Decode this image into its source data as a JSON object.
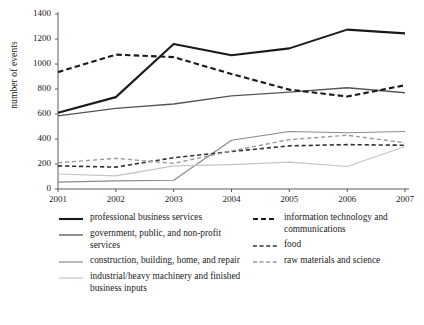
{
  "chart_data": {
    "type": "line",
    "title": "",
    "xlabel": "",
    "ylabel": "number of events",
    "x": [
      2001,
      2002,
      2003,
      2004,
      2005,
      2006,
      2007
    ],
    "xtick_labels": [
      "2001",
      "2002",
      "2003",
      "2004",
      "2005",
      "2006",
      "2007"
    ],
    "ytick_labels": [
      "0",
      "200",
      "400",
      "600",
      "800",
      "1000",
      "1200",
      "1400"
    ],
    "yticks": [
      0,
      200,
      400,
      600,
      800,
      1000,
      1200,
      1400
    ],
    "ylim": [
      0,
      1400
    ],
    "xlim": [
      2001,
      2007
    ],
    "grid": false,
    "legend_position": "below",
    "series": [
      {
        "name": "professional business services",
        "style": "solid",
        "color": "#1a1a1a",
        "width": 2.1,
        "values": [
          610,
          735,
          1160,
          1070,
          1125,
          1275,
          1245
        ]
      },
      {
        "name": "government, public, and non-profit services",
        "style": "solid",
        "color": "#555555",
        "width": 1.3,
        "values": [
          585,
          645,
          680,
          745,
          775,
          810,
          770
        ]
      },
      {
        "name": "construction, building, home, and repair",
        "style": "solid",
        "color": "#8a8a8a",
        "width": 1.2,
        "values": [
          55,
          65,
          70,
          390,
          460,
          450,
          460
        ]
      },
      {
        "name": "industrial/heavy machinery and finished business inputs",
        "style": "solid",
        "color": "#c4c4c4",
        "width": 1.2,
        "values": [
          120,
          105,
          185,
          195,
          215,
          180,
          340
        ]
      },
      {
        "name": "information technology and communications",
        "style": "dashed",
        "color": "#1a1a1a",
        "width": 2.1,
        "values": [
          935,
          1075,
          1055,
          920,
          795,
          740,
          830
        ]
      },
      {
        "name": "food",
        "style": "dashed",
        "color": "#333333",
        "width": 1.6,
        "values": [
          185,
          175,
          250,
          300,
          345,
          355,
          350
        ]
      },
      {
        "name": "raw materials and science",
        "style": "dashed",
        "color": "#9a9a9a",
        "width": 1.4,
        "values": [
          210,
          245,
          205,
          305,
          395,
          430,
          370
        ]
      }
    ]
  },
  "legend": {
    "left_column": [
      {
        "label": "professional business services",
        "swatch": "solid-thick-black"
      },
      {
        "label": "government, public, and non-profit services",
        "swatch": "solid-dark-gray"
      },
      {
        "label": "construction, building, home, and repair",
        "swatch": "solid-medium-gray"
      },
      {
        "label": "industrial/heavy machinery and finished business inputs",
        "swatch": "solid-light-gray"
      }
    ],
    "right_column": [
      {
        "label": "information technology and communications",
        "swatch": "dashed-thick-black"
      },
      {
        "label": "food",
        "swatch": "dashed-dark-gray"
      },
      {
        "label": "raw materials and science",
        "swatch": "dashed-light-gray"
      }
    ]
  },
  "axis": {
    "y_title": "number of events"
  },
  "colors": {
    "axis": "#5a5a5a",
    "text": "#1a1a1a",
    "background": "#ffffff"
  }
}
